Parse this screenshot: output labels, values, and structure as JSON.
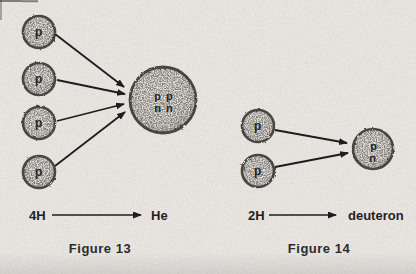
{
  "figure13": {
    "caption": "Figure 13",
    "protons": [
      "p",
      "p",
      "p",
      "p"
    ],
    "product": {
      "line1": "p p",
      "line2": "n n"
    },
    "equation": {
      "lhs": "4H",
      "rhs": "He"
    }
  },
  "figure14": {
    "caption": "Figure 14",
    "protons": [
      "p",
      "p"
    ],
    "product": {
      "line1": "p",
      "line2": "n"
    },
    "equation": {
      "lhs": "2H",
      "rhs": "deuteron"
    }
  },
  "colors": {
    "paper_background": "#eae7e3",
    "particle_fill": "#ddd9d4",
    "particle_edge": "#4a453f",
    "ink": "#1d1d1d"
  }
}
